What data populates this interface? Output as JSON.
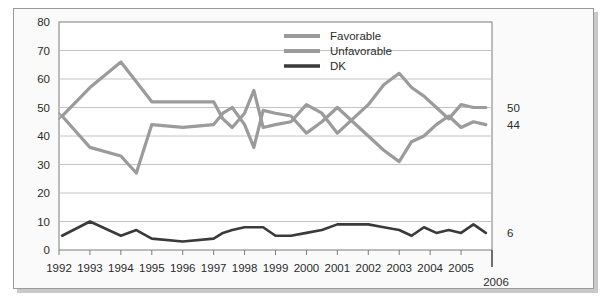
{
  "chart_data": {
    "type": "line",
    "title": "",
    "subtitle": "",
    "xlabel": "",
    "ylabel": "",
    "xlim": [
      1992,
      2006
    ],
    "ylim": [
      0,
      80
    ],
    "grid": true,
    "legend_position": "top-right",
    "y_ticks": [
      "0",
      "10",
      "20",
      "30",
      "40",
      "50",
      "60",
      "70",
      "80"
    ],
    "y_tick_values": [
      0,
      10,
      20,
      30,
      40,
      50,
      60,
      70,
      80
    ],
    "x_ticks": [
      "1992",
      "1993",
      "1994",
      "1995",
      "1996",
      "1997",
      "1998",
      "1999",
      "2000",
      "2001",
      "2002",
      "2003",
      "2004",
      "2005"
    ],
    "x_tick_values": [
      1992,
      1993,
      1994,
      1995,
      1996,
      1997,
      1998,
      1999,
      2000,
      2001,
      2002,
      2003,
      2004,
      2005
    ],
    "x_extra_label": "2006",
    "end_labels": [
      {
        "series": "Favorable",
        "value": "50"
      },
      {
        "series": "Unfavorable",
        "value": "44"
      },
      {
        "series": "DK",
        "value": "6"
      }
    ],
    "series": [
      {
        "name": "Favorable",
        "color": "#9b9b9b",
        "x": [
          1992.1,
          1993.0,
          1994.0,
          1994.5,
          1995.0,
          1996.0,
          1997.0,
          1997.3,
          1997.6,
          1998.0,
          1998.3,
          1998.6,
          1999.0,
          1999.5,
          2000.0,
          2000.5,
          2001.0,
          2001.5,
          2002.0,
          2002.5,
          2003.0,
          2003.4,
          2003.8,
          2004.2,
          2004.6,
          2005.0,
          2005.4,
          2005.8
        ],
        "values": [
          47,
          57,
          66,
          59,
          52,
          52,
          52,
          46,
          43,
          48,
          56,
          43,
          44,
          45,
          51,
          48,
          41,
          46,
          51,
          58,
          62,
          57,
          54,
          50,
          46,
          51,
          50,
          50
        ]
      },
      {
        "name": "Unfavorable",
        "color": "#9b9b9b",
        "x": [
          1992.1,
          1993.0,
          1994.0,
          1994.5,
          1995.0,
          1996.0,
          1997.0,
          1997.3,
          1997.6,
          1998.0,
          1998.3,
          1998.6,
          1999.0,
          1999.5,
          2000.0,
          2000.5,
          2001.0,
          2001.5,
          2002.0,
          2002.5,
          2003.0,
          2003.4,
          2003.8,
          2004.2,
          2004.6,
          2005.0,
          2005.4,
          2005.8
        ],
        "values": [
          47,
          36,
          33,
          27,
          44,
          43,
          44,
          48,
          50,
          44,
          36,
          49,
          48,
          47,
          41,
          45,
          50,
          45,
          40,
          35,
          31,
          38,
          40,
          44,
          47,
          43,
          45,
          44
        ]
      },
      {
        "name": "DK",
        "color": "#3a3a3a",
        "x": [
          1992.1,
          1993.0,
          1994.0,
          1994.5,
          1995.0,
          1996.0,
          1997.0,
          1997.3,
          1997.6,
          1998.0,
          1998.3,
          1998.6,
          1999.0,
          1999.5,
          2000.0,
          2000.5,
          2001.0,
          2001.5,
          2002.0,
          2002.5,
          2003.0,
          2003.4,
          2003.8,
          2004.2,
          2004.6,
          2005.0,
          2005.4,
          2005.8
        ],
        "values": [
          5,
          10,
          5,
          7,
          4,
          3,
          4,
          6,
          7,
          8,
          8,
          8,
          5,
          5,
          6,
          7,
          9,
          9,
          9,
          8,
          7,
          5,
          8,
          6,
          7,
          6,
          9,
          6
        ]
      }
    ],
    "legend": [
      {
        "label": "Favorable",
        "color": "#9b9b9b"
      },
      {
        "label": "Unfavorable",
        "color": "#9b9b9b"
      },
      {
        "label": "DK",
        "color": "#3a3a3a"
      }
    ],
    "colors": {
      "favorable": "#9b9b9b",
      "unfavorable": "#9b9b9b",
      "dk": "#3a3a3a",
      "grid": "#c4c4c4",
      "axis": "#7a7a7a",
      "frame_bg": "#fafafa",
      "page_bg": "#ffffff",
      "text": "#2b2b2b"
    }
  }
}
